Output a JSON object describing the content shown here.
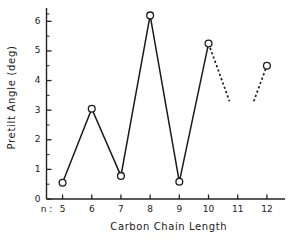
{
  "chart_data": {
    "type": "line",
    "title": "",
    "xlabel": "Carbon  Chain  Length",
    "ylabel": "Pretilt  Angle  (deg)",
    "x_prefix_label": "n :",
    "x": [
      5,
      6,
      7,
      8,
      9,
      10,
      12
    ],
    "values": [
      0.55,
      3.05,
      0.78,
      6.2,
      0.58,
      5.25,
      4.5
    ],
    "series": [
      {
        "name": "Pretilt angle vs carbon chain length",
        "x": [
          5,
          6,
          7,
          8,
          9,
          10,
          12
        ],
        "values": [
          0.55,
          3.05,
          0.78,
          6.2,
          0.58,
          5.25,
          4.5
        ],
        "marker": "open-circle",
        "solid_segment_x": [
          5,
          6,
          7,
          8,
          9,
          10
        ],
        "solid_segment_values": [
          0.55,
          3.05,
          0.78,
          6.2,
          0.58,
          5.25
        ],
        "dashed_segments": [
          {
            "x": [
              10,
              10.72
            ],
            "values": [
              5.25,
              3.3
            ]
          },
          {
            "x": [
              11.55,
              12
            ],
            "values": [
              3.3,
              4.5
            ]
          }
        ]
      }
    ],
    "xlim": [
      4.45,
      12.62
    ],
    "ylim": [
      0,
      6.45
    ],
    "xticks": [
      5,
      6,
      7,
      8,
      9,
      10,
      11,
      12
    ],
    "xtick_labels": [
      "5",
      "6",
      "7",
      "8",
      "9",
      "10",
      "11",
      "12"
    ],
    "yticks": [
      0,
      1,
      2,
      3,
      4,
      5,
      6
    ],
    "ytick_labels": [
      "0",
      "1",
      "2",
      "3",
      "4",
      "5",
      "6"
    ],
    "y_minor_ticks": [
      0.5,
      1.5,
      2.5,
      3.5,
      4.5,
      5.5,
      6.25
    ],
    "grid": false,
    "legend": null,
    "line_color": "#1a1a1a",
    "marker_face_color": "#ffffff",
    "background_color": "#ffffff"
  }
}
